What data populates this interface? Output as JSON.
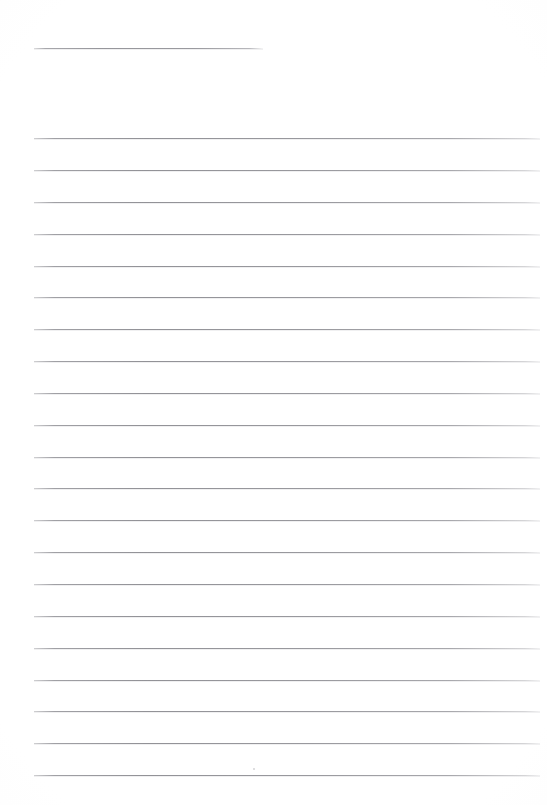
{
  "page": {
    "width_px": 547,
    "height_px": 805,
    "background_color": "#fefefe",
    "rule_color": "#96969b",
    "rule_thickness_px": 1,
    "text_content": "",
    "visible_text": []
  },
  "header_rule": {
    "name": "header-rule",
    "x_start_px": 34,
    "x_end_px": 263,
    "y_px": 48,
    "length_px": 229
  },
  "ruling": {
    "line_count": 21,
    "first_line_y_px": 138,
    "last_line_y_px": 775,
    "line_spacing_px": 31.85,
    "x_start_px": 34,
    "x_end_px": 540,
    "line_length_px": 506,
    "y_positions": [
      138,
      170,
      202,
      234,
      266,
      297,
      329,
      361,
      393,
      425,
      457,
      488,
      520,
      552,
      584,
      616,
      648,
      680,
      711,
      743,
      775
    ]
  },
  "artifacts": {
    "speck": {
      "name": "scan-speck",
      "x_px": 253,
      "y_px": 768,
      "size_px": 2
    }
  }
}
